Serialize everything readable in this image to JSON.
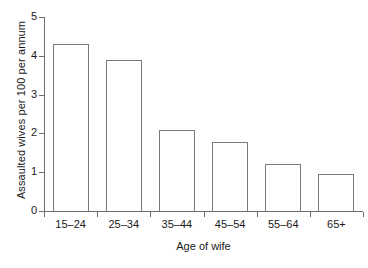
{
  "chart_data": {
    "type": "bar",
    "title": "",
    "xlabel": "Age of wife",
    "ylabel": "Assaulted wives per 100 per annum",
    "categories": [
      "15–24",
      "25–34",
      "35–44",
      "45–54",
      "55–64",
      "65+"
    ],
    "values": [
      4.3,
      3.9,
      2.1,
      1.78,
      1.2,
      0.95
    ],
    "ylim": [
      0,
      5
    ],
    "yticks": [
      0,
      1,
      2,
      3,
      4,
      5
    ],
    "ytick_labels": [
      "0",
      "1",
      "2",
      "3",
      "4",
      "5"
    ],
    "grid": false,
    "legend": null,
    "series": [
      {
        "name": "Assaulted wives per 100 per annum",
        "values": [
          4.3,
          3.9,
          2.1,
          1.78,
          1.2,
          0.95
        ]
      }
    ]
  },
  "style": {
    "bar_fill": "#ffffff",
    "bar_stroke": "#7a7a7a",
    "axis_color": "#6e6e6e",
    "text_color": "#1a1a1a",
    "background": "#ffffff"
  }
}
